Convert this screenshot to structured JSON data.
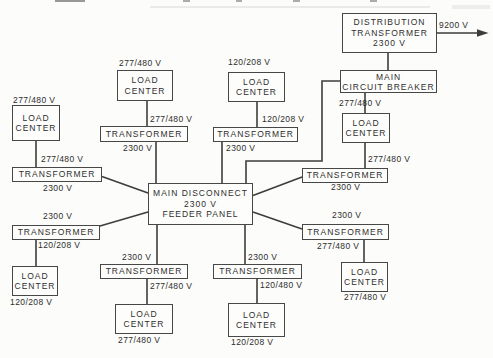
{
  "diagram_title": "Electrical distribution one-line block diagram",
  "colors": {
    "page_background": "#fcfcfa",
    "box_border": "#474747",
    "wire": "#3d3d3d",
    "text": "#2e2e2e"
  },
  "nodes": [
    {
      "id": "distribution-transformer",
      "lines": [
        "DISTRIBUTION",
        "TRANSFORMER",
        "2300 V"
      ]
    },
    {
      "id": "main-circuit-breaker",
      "lines": [
        "MAIN",
        "CIRCUIT BREAKER"
      ]
    },
    {
      "id": "main-disconnect-feeder-panel",
      "lines": [
        "MAIN DISCONNECT",
        "2300 V",
        "FEEDER PANEL"
      ]
    },
    {
      "id": "load-center-top-left",
      "lines": [
        "LOAD",
        "CENTER"
      ]
    },
    {
      "id": "load-center-top-mid",
      "lines": [
        "LOAD",
        "CENTER"
      ]
    },
    {
      "id": "load-center-left",
      "lines": [
        "LOAD",
        "CENTER"
      ]
    },
    {
      "id": "transformer-top-left",
      "lines": [
        "TRANSFORMER"
      ]
    },
    {
      "id": "transformer-top-mid",
      "lines": [
        "TRANSFORMER"
      ]
    },
    {
      "id": "transformer-left-mid",
      "lines": [
        "TRANSFORMER"
      ]
    },
    {
      "id": "transformer-left-lower",
      "lines": [
        "TRANSFORMER"
      ]
    },
    {
      "id": "load-center-left-lower",
      "lines": [
        "LOAD",
        "CENTER"
      ]
    },
    {
      "id": "transformer-bottom-left",
      "lines": [
        "TRANSFORMER"
      ]
    },
    {
      "id": "load-center-bottom-left",
      "lines": [
        "LOAD",
        "CENTER"
      ]
    },
    {
      "id": "transformer-bottom-right",
      "lines": [
        "TRANSFORMER"
      ]
    },
    {
      "id": "load-center-bottom-right",
      "lines": [
        "LOAD",
        "CENTER"
      ]
    },
    {
      "id": "transformer-right-upper",
      "lines": [
        "TRANSFORMER"
      ]
    },
    {
      "id": "load-center-right-upper",
      "lines": [
        "LOAD",
        "CENTER"
      ]
    },
    {
      "id": "transformer-right-lower",
      "lines": [
        "TRANSFORMER"
      ]
    },
    {
      "id": "load-center-right-lower",
      "lines": [
        "LOAD",
        "CENTER"
      ]
    }
  ],
  "labels": [
    {
      "text": "9200 V"
    },
    {
      "text": "277/480 V"
    },
    {
      "text": "120/208 V"
    },
    {
      "text": "277/480 V"
    },
    {
      "text": "277/480 V"
    },
    {
      "text": "120/208 V"
    },
    {
      "text": "2300 V"
    },
    {
      "text": "2300 V"
    },
    {
      "text": "277/480 V"
    },
    {
      "text": "2300 V"
    },
    {
      "text": "2300 V"
    },
    {
      "text": "120/208 V"
    },
    {
      "text": "120/208 V"
    },
    {
      "text": "2300 V"
    },
    {
      "text": "277/480 V"
    },
    {
      "text": "277/480 V"
    },
    {
      "text": "2300 V"
    },
    {
      "text": "120/480 V"
    },
    {
      "text": "120/208 V"
    },
    {
      "text": "277/480 V"
    },
    {
      "text": "277/480 V"
    },
    {
      "text": "2300 V"
    },
    {
      "text": "2300 V"
    },
    {
      "text": "277/480 V"
    },
    {
      "text": "277/480 V"
    }
  ]
}
